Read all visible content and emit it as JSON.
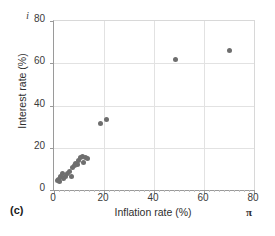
{
  "panel": {
    "label": "(c)"
  },
  "symbols": {
    "y_axis_variable": "i",
    "x_axis_variable": "π"
  },
  "chart_data": {
    "type": "scatter",
    "title": "",
    "xlabel": "Inflation rate (%)",
    "ylabel": "Interest rate (%)",
    "xlim": [
      0,
      80
    ],
    "ylim": [
      0,
      80
    ],
    "xticks": [
      0,
      20,
      40,
      60,
      80
    ],
    "yticks": [
      0,
      20,
      40,
      60,
      80
    ],
    "xtick_labels": [
      "0",
      "20",
      "40",
      "60",
      "80"
    ],
    "ytick_labels": [
      "0",
      "20",
      "40",
      "60",
      "80"
    ],
    "grid": true,
    "legend": false,
    "marker_color": "#6e6e6e",
    "points": [
      {
        "x": 1.2,
        "y": 4.4
      },
      {
        "x": 1.6,
        "y": 5.2
      },
      {
        "x": 2.0,
        "y": 3.8
      },
      {
        "x": 2.4,
        "y": 6.2
      },
      {
        "x": 3.2,
        "y": 7.6
      },
      {
        "x": 3.6,
        "y": 5.6
      },
      {
        "x": 4.4,
        "y": 6.6
      },
      {
        "x": 5.2,
        "y": 8.0
      },
      {
        "x": 6.0,
        "y": 8.6
      },
      {
        "x": 6.8,
        "y": 6.4
      },
      {
        "x": 7.2,
        "y": 10.6
      },
      {
        "x": 8.0,
        "y": 11.6
      },
      {
        "x": 8.4,
        "y": 12.4
      },
      {
        "x": 9.2,
        "y": 12.0
      },
      {
        "x": 9.6,
        "y": 13.8
      },
      {
        "x": 10.4,
        "y": 15.2
      },
      {
        "x": 11.2,
        "y": 16.0
      },
      {
        "x": 11.6,
        "y": 13.0
      },
      {
        "x": 12.4,
        "y": 15.6
      },
      {
        "x": 13.2,
        "y": 15.0
      },
      {
        "x": 18.6,
        "y": 31.6
      },
      {
        "x": 21.0,
        "y": 33.2
      },
      {
        "x": 48.6,
        "y": 62.0
      },
      {
        "x": 70.2,
        "y": 66.2
      }
    ]
  }
}
